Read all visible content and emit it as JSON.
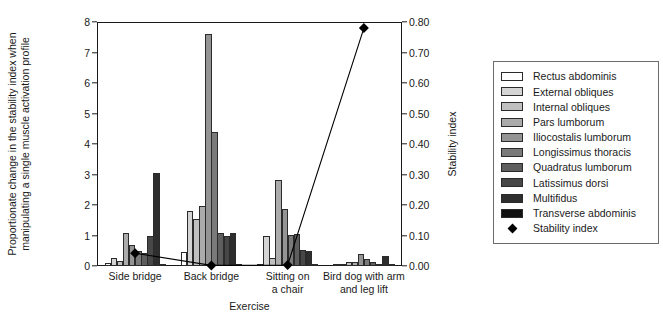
{
  "chart_data": {
    "type": "bar",
    "title": "",
    "xlabel": "Exercise",
    "ylabel": "Proportionate change in the stability index when manipulating a single muscle activation profile",
    "ylabel_right": "Stability index",
    "categories": [
      "Side bridge",
      "Back bridge",
      "Sitting on\na chair",
      "Bird dog with arm\nand leg lift"
    ],
    "ylim": [
      0,
      8
    ],
    "yticks": [
      "0",
      "1",
      "2",
      "3",
      "4",
      "5",
      "6",
      "7",
      "8"
    ],
    "ylim_right": [
      0.0,
      0.8
    ],
    "yticks_right": [
      "0.00",
      "0.10",
      "0.20",
      "0.30",
      "0.40",
      "0.50",
      "0.60",
      "0.70",
      "0.80"
    ],
    "grid": false,
    "legend_position": "right-outside",
    "series": [
      {
        "name": "Rectus abdominis",
        "color": "#ffffff",
        "values": [
          0.1,
          0.46,
          0.05,
          0.02
        ]
      },
      {
        "name": "External obliques",
        "color": "#d4d4d4",
        "values": [
          0.27,
          1.8,
          1.0,
          0.06
        ]
      },
      {
        "name": "Internal obliques",
        "color": "#c0c0c0",
        "values": [
          0.18,
          1.54,
          0.26,
          0.12
        ]
      },
      {
        "name": "Pars lumborum",
        "color": "#ababab",
        "values": [
          1.09,
          1.96,
          2.83,
          0.14
        ]
      },
      {
        "name": "Iliocostalis lumborum",
        "color": "#949494",
        "values": [
          0.69,
          7.6,
          1.88,
          0.38
        ]
      },
      {
        "name": "Longissimus thoracis",
        "color": "#7a7a7a",
        "values": [
          0.5,
          4.4,
          1.02,
          0.24
        ]
      },
      {
        "name": "Quadratus lumborum",
        "color": "#5e5e5e",
        "values": [
          0.44,
          1.08,
          1.05,
          0.13
        ]
      },
      {
        "name": "Latissimus dorsi",
        "color": "#474747",
        "values": [
          1.0,
          0.97,
          0.52,
          0.07
        ]
      },
      {
        "name": "Multifidus",
        "color": "#2e2e2e",
        "values": [
          3.05,
          1.08,
          0.48,
          0.34
        ]
      },
      {
        "name": "Transverse abdominis",
        "color": "#111111",
        "values": [
          0.06,
          0.05,
          0.04,
          0.03
        ]
      }
    ],
    "overlay_series": {
      "name": "Stability index",
      "marker": "diamond",
      "color": "#000000",
      "axis": "right",
      "values": [
        0.042,
        0.002,
        0.003,
        0.78
      ]
    }
  },
  "legend": {
    "entries": [
      {
        "label": "Rectus abdominis"
      },
      {
        "label": "External obliques"
      },
      {
        "label": "Internal obliques"
      },
      {
        "label": "Pars lumborum"
      },
      {
        "label": "Iliocostalis lumborum"
      },
      {
        "label": "Longissimus thoracis"
      },
      {
        "label": "Quadratus lumborum"
      },
      {
        "label": "Latissimus dorsi"
      },
      {
        "label": "Multifidus"
      },
      {
        "label": "Transverse abdominis"
      },
      {
        "label": "Stability index"
      }
    ]
  }
}
